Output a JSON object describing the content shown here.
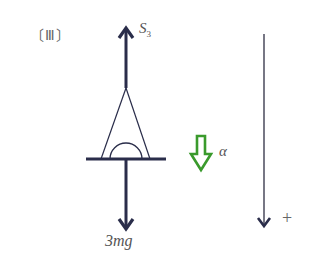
{
  "figure": {
    "panel_label": "〔Ⅲ〕",
    "panel_label_text": "(III)",
    "forces": {
      "tension": {
        "symbol": "S",
        "subscript": "3",
        "direction": "up"
      },
      "weight": {
        "label": "3mg",
        "direction": "down"
      }
    },
    "acceleration": {
      "symbol": "α",
      "direction": "down"
    },
    "positive_direction": {
      "label": "+",
      "direction": "down"
    },
    "colors": {
      "force_arrow": "#2a2d4a",
      "acceleration_arrow": "#3a9a2c",
      "axis_arrow": "#555566",
      "text": "#555555"
    }
  }
}
